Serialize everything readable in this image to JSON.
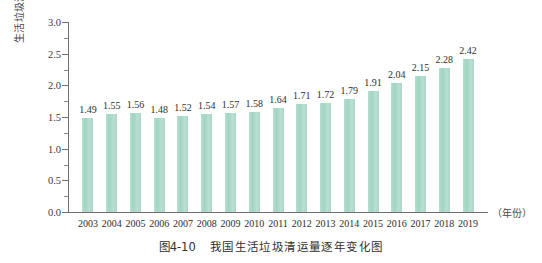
{
  "chart_data": {
    "type": "bar",
    "title": "",
    "caption_number": "图4-10",
    "caption_text": "我国生活垃圾清运量逐年变化图",
    "xlabel": "（年份）",
    "ylabel": "生活垃圾清运量（亿吨）",
    "categories": [
      "2003",
      "2004",
      "2005",
      "2006",
      "2007",
      "2008",
      "2009",
      "2010",
      "2011",
      "2012",
      "2013",
      "2014",
      "2015",
      "2016",
      "2017",
      "2018",
      "2019"
    ],
    "values": [
      1.49,
      1.55,
      1.56,
      1.48,
      1.52,
      1.54,
      1.57,
      1.58,
      1.64,
      1.71,
      1.72,
      1.79,
      1.91,
      2.04,
      2.15,
      2.28,
      2.42
    ],
    "value_labels": [
      "1.49",
      "1.55",
      "1.56",
      "1.48",
      "1.52",
      "1.54",
      "1.57",
      "1.58",
      "1.64",
      "1.71",
      "1.72",
      "1.79",
      "1.91",
      "2.04",
      "2.15",
      "2.28",
      "2.42"
    ],
    "ylim": [
      0.0,
      3.0
    ],
    "ytick_values": [
      0.0,
      0.5,
      1.0,
      1.5,
      2.0,
      2.5,
      3.0
    ],
    "ytick_labels": [
      "0.0",
      "0.5",
      "1.0",
      "1.5",
      "2.0",
      "2.5",
      "3.0"
    ],
    "yminor_values": [
      0.25,
      0.75,
      1.25,
      1.75,
      2.25,
      2.75
    ],
    "grid": false,
    "legend": null,
    "bar_color": "#aad9c9",
    "axis_color": "#6f6f6f"
  }
}
